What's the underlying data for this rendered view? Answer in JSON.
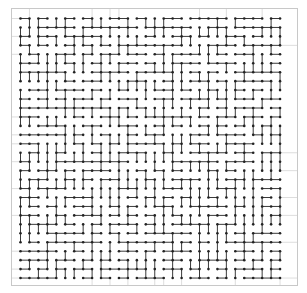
{
  "diagram": {
    "type": "maze-spanning-tree",
    "width": 307,
    "height": 293,
    "background": "#ffffff",
    "frame": {
      "x": 11,
      "y": 8,
      "width": 286,
      "height": 277,
      "color": "#c8c8c8",
      "line_width": 1
    },
    "grid": {
      "cols": 30,
      "rows": 30,
      "origin_x": 20.5,
      "origin_y": 18.5,
      "pitch_x": 8.95,
      "pitch_y": 8.95
    },
    "guide_lines_color": "#d4d4d4",
    "edge_color": "#3a3a3a",
    "edge_width": 1,
    "node_color": "#222222",
    "node_radius": 1.3,
    "seed": 7
  }
}
